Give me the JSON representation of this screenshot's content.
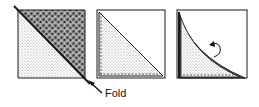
{
  "diagram": {
    "steps": [
      {
        "index": 1,
        "name": "square-with-diagonal-fold",
        "fold_label": "Fold"
      },
      {
        "index": 2,
        "name": "half-square-triangle-pressed"
      },
      {
        "index": 3,
        "name": "curved-fold-with-rotate-arrow"
      }
    ],
    "labels": {
      "fold": "Fold"
    },
    "colors": {
      "ink": "#1a1a1a",
      "paper": "#ffffff"
    }
  }
}
